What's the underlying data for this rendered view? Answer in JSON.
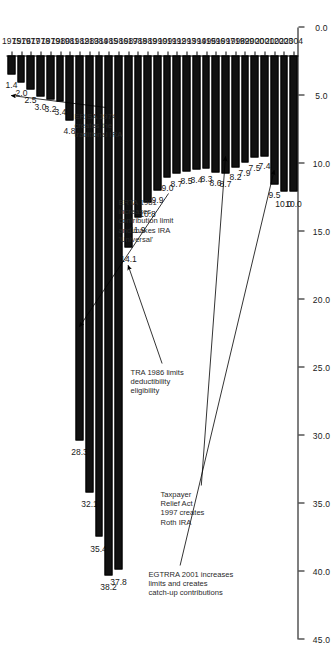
{
  "chart_data": {
    "type": "bar",
    "orientation": "vertical-rotated",
    "title": "",
    "xlabel": "",
    "ylabel": "",
    "ylim": [
      0.0,
      45.0
    ],
    "grid": false,
    "legend": null,
    "categories": [
      "1975",
      "1976",
      "1977",
      "1978",
      "1979",
      "1980",
      "1981",
      "1982",
      "1983",
      "1984",
      "1985",
      "1986",
      "1987",
      "1988",
      "1989",
      "1990",
      "1991",
      "1992",
      "1993",
      "1994",
      "1995",
      "1996",
      "1997",
      "1998",
      "1999",
      "2000",
      "2001",
      "2002",
      "2003",
      "2004"
    ],
    "values": [
      1.4,
      2.0,
      2.5,
      3.0,
      3.2,
      3.4,
      4.8,
      28.3,
      32.1,
      35.4,
      38.2,
      37.8,
      14.1,
      11.9,
      10.8,
      9.9,
      9.0,
      8.7,
      8.5,
      8.4,
      8.3,
      8.6,
      8.7,
      8.2,
      7.9,
      7.5,
      7.4,
      9.5,
      10.0,
      10.0
    ],
    "value_labels": [
      "1.4",
      "2.0",
      "2.5",
      "3.0",
      "3.2",
      "3.4",
      "4.8",
      "28.3",
      "32.1",
      "35.4",
      "38.2",
      "37.8",
      "14.1",
      "11.9",
      "10.8",
      "9.9",
      "9.0",
      "8.7",
      "8.5",
      "8.4",
      "8.3",
      "8.6",
      "8.7",
      "8.2",
      "7.9",
      "7.5",
      "7.4",
      "9.5",
      "10.0",
      "10.0"
    ],
    "y_ticks": [
      0.0,
      5.0,
      10.0,
      15.0,
      20.0,
      25.0,
      30.0,
      35.0,
      40.0,
      45.0
    ],
    "y_tick_labels": [
      "0.0",
      "5.0",
      "10.0",
      "15.0",
      "20.0",
      "25.0",
      "30.0",
      "35.0",
      "40.0",
      "45.0"
    ],
    "bar_color": "#111111",
    "annotations": [
      {
        "id": "erisa-1974",
        "lines": [
          "ERISA 1974",
          "creates the",
          "traditional IRA"
        ],
        "target_category": "1975",
        "target_value": 5.0
      },
      {
        "id": "erta-1981",
        "lines": [
          "ERTA 1981",
          "increases",
          "contribution limit",
          "and makes IRA",
          "'Universal'"
        ],
        "target_category": "1982",
        "target_value": 22.0
      },
      {
        "id": "tra-1986",
        "lines": [
          "TRA 1986 limits",
          "deductibility",
          "eligibility"
        ],
        "target_category": "1987",
        "target_value": 17.5
      },
      {
        "id": "tra-1997",
        "lines": [
          "Taxpayer",
          "Relief Act",
          "1997 creates",
          "Roth IRA"
        ],
        "target_category": "1997",
        "target_value": 9.5
      },
      {
        "id": "egtrra-2001",
        "lines": [
          "EGTRRA 2001 increases",
          "limits and creates",
          "catch-up contributions"
        ],
        "target_category": "2002",
        "target_value": 10.5
      }
    ]
  }
}
